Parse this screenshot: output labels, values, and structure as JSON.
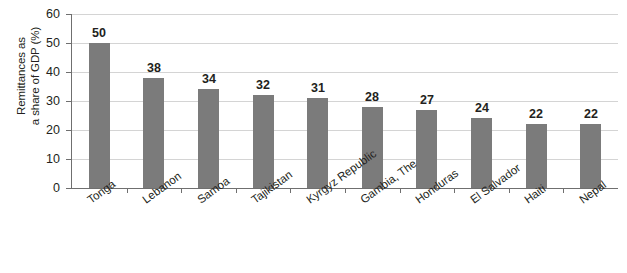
{
  "chart_data": {
    "type": "bar",
    "title": "",
    "subtitle": "",
    "xlabel": "",
    "ylabel": "Remittances as\na share of GDP (%)",
    "categories": [
      "Tonga",
      "Lebanon",
      "Samoa",
      "Tajikistan",
      "Kyrgyz Republic",
      "Gambia, The",
      "Honduras",
      "El Salvador",
      "Haiti",
      "Nepal"
    ],
    "values": [
      50,
      38,
      34,
      32,
      31,
      28,
      27,
      24,
      22,
      22
    ],
    "value_labels": [
      "50",
      "38",
      "34",
      "32",
      "31",
      "28",
      "27",
      "24",
      "22",
      "22"
    ],
    "ylim": [
      0,
      60
    ],
    "yticks": [
      0,
      10,
      20,
      30,
      40,
      50,
      60
    ],
    "ytick_labels": [
      "0",
      "10",
      "20",
      "30",
      "40",
      "50",
      "60"
    ],
    "grid": true,
    "grid_orientation": "horizontal",
    "legend": false,
    "legend_position": "none",
    "bar_color": "#7b7b7b",
    "gridline_color": "#d4d4d4",
    "axis_color": "#6f6f6f",
    "text_color": "#231f20",
    "background_color": "#ffffff",
    "category_label_rotation": -36
  }
}
